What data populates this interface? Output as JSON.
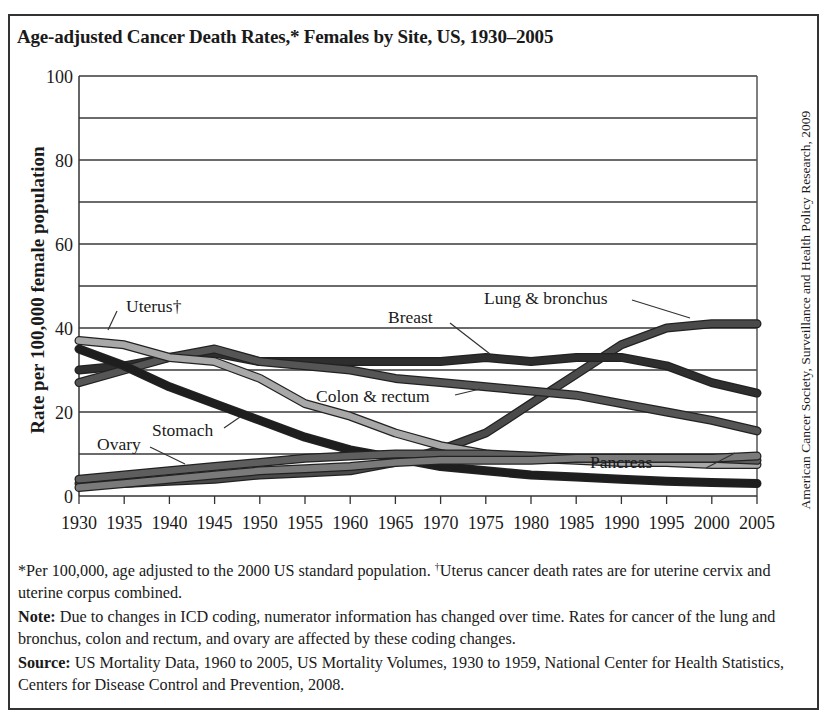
{
  "title": "Age-adjusted Cancer Death Rates,* Females by Site, US, 1930–2005",
  "ylabel": "Rate per 100,000 female population",
  "credit": "American Cancer Society, Surveillance and Health Policy Research, 2009",
  "notes": {
    "footnote_part1": "*Per 100,000, age adjusted to the 2000 US standard population. ",
    "dagger": "†",
    "footnote_part2": "Uterus cancer death rates are for uterine cervix and uterine corpus combined.",
    "note_label": "Note:",
    "note_text": " Due to changes in ICD coding, numerator information has changed over time. Rates for cancer of the lung and bronchus, colon and rectum, and ovary are affected by these coding changes.",
    "source_label": "Source:",
    "source_text": " US Mortality Data, 1960 to 2005, US Mortality Volumes, 1930 to 1959, National Center for Health Statistics, Centers for Disease Control and Prevention, 2008."
  },
  "chart_data": {
    "type": "line",
    "title": "Age-adjusted Cancer Death Rates,* Females by Site, US, 1930–2005",
    "xlabel": "",
    "ylabel": "Rate per 100,000 female population",
    "xlim": [
      1930,
      2005
    ],
    "ylim": [
      0,
      100
    ],
    "grid": true,
    "gridlines_y": [
      10,
      20,
      30,
      40,
      50,
      60,
      70,
      80,
      90,
      100
    ],
    "x_ticks": [
      1930,
      1935,
      1940,
      1945,
      1950,
      1955,
      1960,
      1965,
      1970,
      1975,
      1980,
      1985,
      1990,
      1995,
      2000,
      2005
    ],
    "y_ticks": [
      0,
      20,
      40,
      60,
      80,
      100
    ],
    "x": [
      1930,
      1935,
      1940,
      1945,
      1950,
      1955,
      1960,
      1965,
      1970,
      1975,
      1980,
      1985,
      1990,
      1995,
      2000,
      2005
    ],
    "series": [
      {
        "name": "Lung & bronchus",
        "color": "#4a4a4a",
        "values": [
          3,
          3,
          3.5,
          4,
          5,
          5.5,
          6,
          8,
          11,
          15,
          22,
          29,
          36,
          40,
          41,
          41
        ]
      },
      {
        "name": "Breast",
        "color": "#2e2e2e",
        "values": [
          30,
          31,
          33,
          34,
          32,
          32,
          32,
          32,
          32,
          33,
          32,
          33,
          33,
          31,
          27,
          24.5
        ]
      },
      {
        "name": "Colon & rectum",
        "color": "#555555",
        "values": [
          27,
          30,
          33,
          35,
          32,
          31,
          30,
          28,
          27,
          26,
          25,
          24,
          22,
          20,
          18,
          15.5
        ]
      },
      {
        "name": "Uterus†",
        "color": "#a8a8a8",
        "values": [
          37,
          36,
          33,
          32,
          28,
          22,
          19,
          15,
          12,
          10,
          9,
          8.5,
          8,
          8,
          7.5,
          7.5
        ]
      },
      {
        "name": "Stomach",
        "color": "#1e1e1e",
        "values": [
          35,
          31,
          26,
          22,
          18,
          14,
          11,
          9,
          7,
          6,
          5,
          4.5,
          4,
          3.5,
          3.2,
          3
        ]
      },
      {
        "name": "Ovary",
        "color": "#5e5e5e",
        "values": [
          4,
          5,
          6,
          7,
          8,
          9,
          9.5,
          10,
          10,
          10,
          9.5,
          9,
          9,
          9,
          9,
          8.5
        ]
      },
      {
        "name": "Pancreas",
        "color": "#7a7a7a",
        "values": [
          2,
          3,
          4,
          5,
          6,
          6.5,
          7,
          8,
          8.5,
          8.5,
          8.5,
          9,
          9,
          9,
          9,
          9.5
        ]
      }
    ],
    "annotations": [
      {
        "text": "Uterus†",
        "x": 1934,
        "y": 41
      },
      {
        "text": "Breast",
        "x": 1962,
        "y": 39
      },
      {
        "text": "Lung & bronchus",
        "x": 1975,
        "y": 46
      },
      {
        "text": "Colon & rectum",
        "x": 1955,
        "y": 23
      },
      {
        "text": "Stomach",
        "x": 1937,
        "y": 15
      },
      {
        "text": "Ovary",
        "x": 1932,
        "y": 12
      },
      {
        "text": "Pancreas",
        "x": 1987,
        "y": 9
      }
    ]
  }
}
